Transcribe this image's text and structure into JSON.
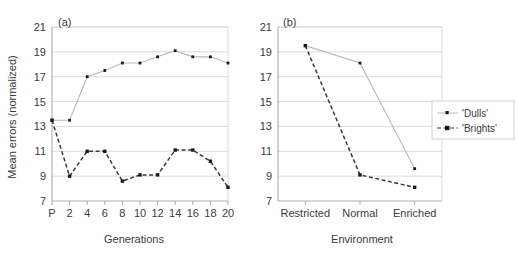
{
  "figure": {
    "background": "#ffffff",
    "series_colors": {
      "dulls_line": "#b9b9b9",
      "brights_line": "#3a3a3a",
      "marker": "#1a1a1a",
      "grid": "#d2d2d2",
      "axis": "#9a9a9a",
      "text": "#3b3b3b"
    }
  },
  "legend": {
    "position": "right",
    "entries": [
      {
        "label": "'Dulls'",
        "style": "solid",
        "marker": "dot"
      },
      {
        "label": "'Brights'",
        "style": "dashed",
        "marker": "square"
      }
    ]
  },
  "chart_data": [
    {
      "type": "line",
      "panel": "(a)",
      "title": "",
      "xlabel": "Generations",
      "ylabel": "Mean errors (normalized)",
      "categories": [
        "P",
        "2",
        "4",
        "6",
        "8",
        "10",
        "12",
        "14",
        "16",
        "18",
        "20"
      ],
      "ylim": [
        7,
        21
      ],
      "yticks": [
        7,
        9,
        11,
        13,
        15,
        17,
        19,
        21
      ],
      "grid": true,
      "series": [
        {
          "name": "'Dulls'",
          "style": "solid",
          "values": [
            13.5,
            13.5,
            17.0,
            17.5,
            18.1,
            18.1,
            18.6,
            19.1,
            18.6,
            18.6,
            18.1
          ]
        },
        {
          "name": "'Brights'",
          "style": "dashed",
          "values": [
            13.5,
            9.0,
            11.0,
            11.0,
            8.6,
            9.1,
            9.1,
            11.1,
            11.1,
            10.2,
            8.1
          ]
        }
      ]
    },
    {
      "type": "line",
      "panel": "(b)",
      "title": "",
      "xlabel": "Environment",
      "ylabel": "",
      "categories": [
        "Restricted",
        "Normal",
        "Enriched"
      ],
      "ylim": [
        7,
        21
      ],
      "yticks": [
        7,
        9,
        11,
        13,
        15,
        17,
        19,
        21
      ],
      "grid": true,
      "series": [
        {
          "name": "'Dulls'",
          "style": "solid",
          "values": [
            19.5,
            18.1,
            9.6
          ]
        },
        {
          "name": "'Brights'",
          "style": "dashed",
          "values": [
            19.5,
            9.1,
            8.1
          ]
        }
      ]
    }
  ]
}
